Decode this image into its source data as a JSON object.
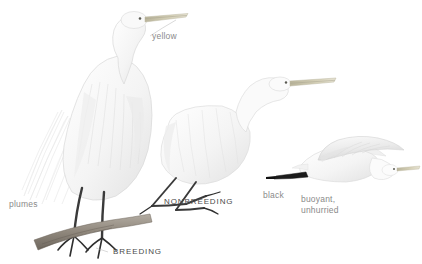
{
  "plate": {
    "subject": "great egret",
    "background_color": "#ffffff",
    "label_color": "#8a8a8a",
    "caps_label_color": "#4a4a4a"
  },
  "annotations": {
    "yellow": "yellow",
    "plumes": "plumes",
    "black": "black",
    "flight_note": "buoyant,\nunhurried"
  },
  "plumage_labels": {
    "breeding": "BREEDING",
    "nonbreeding": "NONBREEDING"
  },
  "figures": [
    {
      "name": "standing-breeding-egret",
      "pose": "standing on branch, neck curved, long trailing plumes",
      "plumage": "BREEDING",
      "bill_color": "#d8d2bd",
      "leg_color": "#3c3c3c",
      "body_color": "#f6f6f6"
    },
    {
      "name": "standing-nonbreeding-egret",
      "pose": "crouched, neck extended forward horizontally",
      "plumage": "NONBREEDING",
      "bill_color": "#cfccbb",
      "leg_color": "#3c3c3c",
      "body_color": "#f7f7f7"
    },
    {
      "name": "flying-egret",
      "pose": "in flight, wings raised, legs trailing",
      "plumage": "flight",
      "bill_color": "#d0ccb8",
      "leg_color": "#2b2b2b",
      "body_color": "#f4f4f4"
    }
  ]
}
